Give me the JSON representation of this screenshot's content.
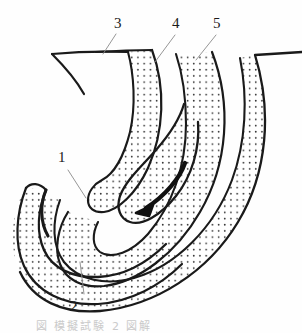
{
  "figure": {
    "type": "line-art-cross-section-diagram",
    "background_color": "#fefefe",
    "ink_color": "#1a1a1a",
    "stipple_color": "#2b2b2b",
    "labels": [
      {
        "id": "1",
        "text": "1",
        "x": 60,
        "y": 150
      },
      {
        "id": "2",
        "text": "2",
        "x": 72,
        "y": 300
      },
      {
        "id": "3",
        "text": "3",
        "x": 116,
        "y": 16
      },
      {
        "id": "4",
        "text": "4",
        "x": 172,
        "y": 16
      },
      {
        "id": "5",
        "text": "5",
        "x": 213,
        "y": 16
      }
    ],
    "leader_lines": [
      {
        "for": "1",
        "from": [
          68,
          170
        ],
        "to": [
          84,
          196
        ]
      },
      {
        "for": "2",
        "from": [
          80,
          262
        ],
        "to": [
          84,
          294
        ]
      },
      {
        "for": "3",
        "from": [
          103,
          54
        ],
        "to": [
          115,
          34
        ]
      },
      {
        "for": "4",
        "from": [
          155,
          62
        ],
        "to": [
          175,
          36
        ]
      },
      {
        "for": "5",
        "from": [
          196,
          60
        ],
        "to": [
          215,
          36
        ]
      }
    ],
    "arrow": {
      "name": "flow-arrow",
      "path": "M 185 163 C 180 178 165 196 146 208",
      "head_at": [
        140,
        210
      ],
      "direction": "down-left"
    },
    "caption": {
      "text": "図 模擬試験 2 図解",
      "legible": false
    }
  }
}
